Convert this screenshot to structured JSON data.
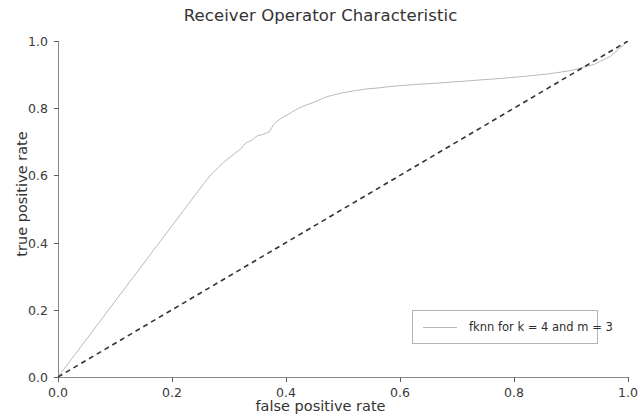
{
  "chart_data": {
    "type": "line",
    "title": "Receiver Operator Characteristic",
    "xlabel": "false positive rate",
    "ylabel": "true positive rate",
    "xlim": [
      0.0,
      1.0
    ],
    "ylim": [
      0.0,
      1.0
    ],
    "xticks": [
      "0.0",
      "0.2",
      "0.4",
      "0.6",
      "0.8",
      "1.0"
    ],
    "xtick_values": [
      0.0,
      0.2,
      0.4,
      0.6,
      0.8,
      1.0
    ],
    "yticks": [
      "0.0",
      "0.2",
      "0.4",
      "0.6",
      "0.8",
      "1.0"
    ],
    "ytick_values": [
      0.0,
      0.2,
      0.4,
      0.6,
      0.8,
      1.0
    ],
    "grid": false,
    "legend_position": "lower right",
    "series": [
      {
        "name": "fknn for k = 4 and m = 3",
        "color": "#b9b9b9",
        "style": "solid",
        "x": [
          0.0,
          0.02,
          0.04,
          0.06,
          0.08,
          0.1,
          0.12,
          0.14,
          0.16,
          0.18,
          0.2,
          0.22,
          0.24,
          0.26,
          0.27,
          0.28,
          0.29,
          0.3,
          0.31,
          0.32,
          0.325,
          0.33,
          0.34,
          0.345,
          0.35,
          0.36,
          0.365,
          0.37,
          0.375,
          0.38,
          0.39,
          0.4,
          0.41,
          0.42,
          0.43,
          0.44,
          0.45,
          0.46,
          0.47,
          0.48,
          0.5,
          0.52,
          0.54,
          0.56,
          0.58,
          0.6,
          0.63,
          0.66,
          0.7,
          0.74,
          0.78,
          0.82,
          0.86,
          0.9,
          0.94,
          0.97,
          1.0
        ],
        "y": [
          0.0,
          0.045,
          0.09,
          0.135,
          0.18,
          0.225,
          0.27,
          0.315,
          0.36,
          0.405,
          0.45,
          0.495,
          0.54,
          0.585,
          0.605,
          0.622,
          0.638,
          0.652,
          0.665,
          0.678,
          0.688,
          0.697,
          0.705,
          0.712,
          0.718,
          0.722,
          0.726,
          0.729,
          0.742,
          0.755,
          0.768,
          0.778,
          0.788,
          0.798,
          0.806,
          0.812,
          0.818,
          0.826,
          0.833,
          0.838,
          0.846,
          0.852,
          0.857,
          0.86,
          0.864,
          0.867,
          0.871,
          0.874,
          0.879,
          0.884,
          0.889,
          0.895,
          0.902,
          0.912,
          0.93,
          0.955,
          1.0
        ]
      },
      {
        "name": "chance diagonal",
        "color": "#33333a",
        "style": "dashed",
        "x": [
          0.0,
          1.0
        ],
        "y": [
          0.0,
          1.0
        ]
      }
    ]
  },
  "legend": {
    "entries": [
      {
        "label": "fknn for k = 4 and m = 3"
      }
    ]
  }
}
